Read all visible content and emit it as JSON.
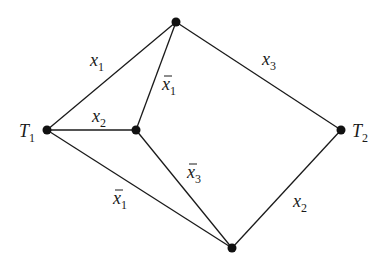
{
  "diagram": {
    "type": "graph",
    "nodes": [
      {
        "id": "top",
        "x": 176,
        "y": 22,
        "label": ""
      },
      {
        "id": "T1",
        "x": 47,
        "y": 130,
        "label": "T",
        "sub": "1"
      },
      {
        "id": "mid",
        "x": 136,
        "y": 130,
        "label": ""
      },
      {
        "id": "T2",
        "x": 341,
        "y": 130,
        "label": "T",
        "sub": "2"
      },
      {
        "id": "bottom",
        "x": 232,
        "y": 248,
        "label": ""
      }
    ],
    "edges": [
      {
        "from": "T1",
        "to": "top",
        "label": "x",
        "sub": "1",
        "negated": false
      },
      {
        "from": "mid",
        "to": "top",
        "label": "x",
        "sub": "1",
        "negated": true
      },
      {
        "from": "top",
        "to": "T2",
        "label": "x",
        "sub": "3",
        "negated": false
      },
      {
        "from": "T1",
        "to": "mid",
        "label": "x",
        "sub": "2",
        "negated": false
      },
      {
        "from": "mid",
        "to": "bottom",
        "label": "x",
        "sub": "3",
        "negated": true
      },
      {
        "from": "T1",
        "to": "bottom",
        "label": "x",
        "sub": "1",
        "negated": true
      },
      {
        "from": "T2",
        "to": "bottom",
        "label": "x",
        "sub": "2",
        "negated": false
      }
    ]
  }
}
